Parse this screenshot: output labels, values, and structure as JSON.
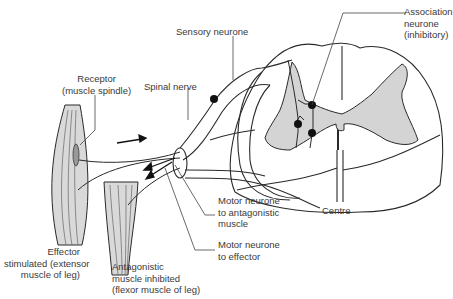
{
  "diagram": {
    "colors": {
      "grey_matter": "#d4d4d4",
      "muscle": "#d9d9d9",
      "outline": "#2a2a2a",
      "text": "#3a3a3a",
      "background": "#ffffff"
    },
    "labels": {
      "sensory_neurone": "Sensory neurone",
      "association_neurone": "Association\nneurone\n(inhibitory)",
      "receptor": "Receptor\n(muscle spindle)",
      "spinal_nerve": "Spinal nerve",
      "motor_antagonistic": "Motor neurone\nto antagonistic\nmuscle",
      "motor_effector": "Motor neurone\nto effector",
      "centre": "Centre",
      "effector": "Effector\nstimulated (extensor\nmuscle of leg)",
      "antagonistic": "Antagonistic\nmuscle inhibited\n(flexor muscle of leg)"
    }
  }
}
